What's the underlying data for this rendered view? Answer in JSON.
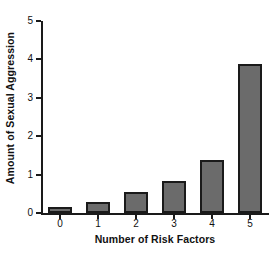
{
  "chart_data": {
    "type": "bar",
    "title": "",
    "xlabel": "Number of Risk Factors",
    "ylabel": "Amount of Sexual Aggression",
    "categories": [
      "0",
      "1",
      "2",
      "3",
      "4",
      "5"
    ],
    "values": [
      0.16,
      0.29,
      0.55,
      0.84,
      1.37,
      3.87
    ],
    "ylim": [
      0,
      5
    ],
    "yticks": [
      "0",
      "1",
      "2",
      "3",
      "4",
      "5"
    ],
    "ytick_values": [
      0,
      1,
      2,
      3,
      4,
      5
    ],
    "xlim": [
      -0.5,
      5.5
    ],
    "grid": false,
    "legend": false,
    "series": [
      {
        "name": "Amount of Sexual Aggression",
        "values": [
          0.16,
          0.29,
          0.55,
          0.84,
          1.37,
          3.87
        ]
      }
    ],
    "colors": {
      "bar_fill": "#6b6b6b",
      "bar_edge": "#1a1a1a",
      "axis": "#1a1a1a",
      "text": "#111111",
      "background": "#ffffff"
    }
  }
}
